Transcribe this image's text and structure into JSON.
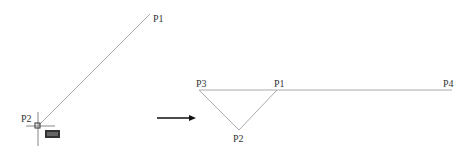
{
  "left_figure": {
    "labels": {
      "p1": "P1",
      "p2": "P2"
    },
    "line": {
      "from": [
        38,
        126
      ],
      "to": [
        150,
        14
      ]
    },
    "cursor": {
      "x": 38,
      "y": 126
    }
  },
  "arrow": {
    "from": [
      157,
      118
    ],
    "to": [
      195,
      118
    ]
  },
  "right_figure": {
    "labels": {
      "p1": "P1",
      "p2": "P2",
      "p3": "P3",
      "p4": "P4"
    },
    "points": {
      "p3": [
        199,
        90
      ],
      "p1": [
        277,
        90
      ],
      "p2": [
        239,
        130
      ],
      "p4": [
        452,
        90
      ]
    }
  },
  "colors": {
    "line": "#aaaaaa",
    "text": "#333333",
    "arrow": "#111111"
  }
}
